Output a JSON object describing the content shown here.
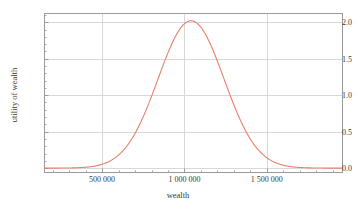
{
  "chart_data": {
    "type": "line",
    "title": "",
    "xlabel": "wealth",
    "ylabel": "utility of wealth",
    "xlim": [
      150000,
      1960000
    ],
    "ylim": [
      -0.06,
      2.12
    ],
    "grid": true,
    "legend": false,
    "legend_position": "none",
    "line_color": "#e8806b",
    "x_ticks": [
      500000,
      1000000,
      1500000
    ],
    "x_tick_labels": [
      "500 000",
      "1 000 000",
      "1 500 000"
    ],
    "y_ticks": [
      0.0,
      0.5,
      1.0,
      1.5,
      2.0
    ],
    "y_tick_labels": [
      "0.0",
      "0.5",
      "1.0",
      "1.5",
      "2.0"
    ],
    "x_minor_tick_count": 4,
    "y_minor_tick_count": 4,
    "series": [
      {
        "name": "utility of wealth",
        "peak_x": 1040000,
        "peak_y": 2.02,
        "sigma": 200000,
        "x": [
          150000,
          200000,
          250000,
          300000,
          350000,
          400000,
          450000,
          500000,
          550000,
          600000,
          650000,
          700000,
          750000,
          800000,
          850000,
          900000,
          950000,
          1000000,
          1040000,
          1100000,
          1150000,
          1200000,
          1250000,
          1300000,
          1350000,
          1400000,
          1450000,
          1500000,
          1550000,
          1600000,
          1700000,
          1800000,
          1900000,
          1960000
        ],
        "y": [
          0.0,
          0.0,
          0.0,
          0.0,
          0.01,
          0.01,
          0.02,
          0.05,
          0.09,
          0.16,
          0.27,
          0.43,
          0.65,
          0.92,
          1.23,
          1.53,
          1.8,
          1.98,
          2.02,
          1.95,
          1.83,
          1.64,
          1.4,
          1.14,
          0.88,
          0.64,
          0.44,
          0.28,
          0.17,
          0.1,
          0.03,
          0.01,
          0.0,
          0.0
        ]
      }
    ]
  },
  "axes": {
    "x_title": "wealth",
    "y_title": "utility of wealth"
  },
  "colors": {
    "curve": "#e8806b",
    "grid": "#d8d8dc",
    "frame": "#9a9a9a",
    "text": "#3a3a3a"
  }
}
